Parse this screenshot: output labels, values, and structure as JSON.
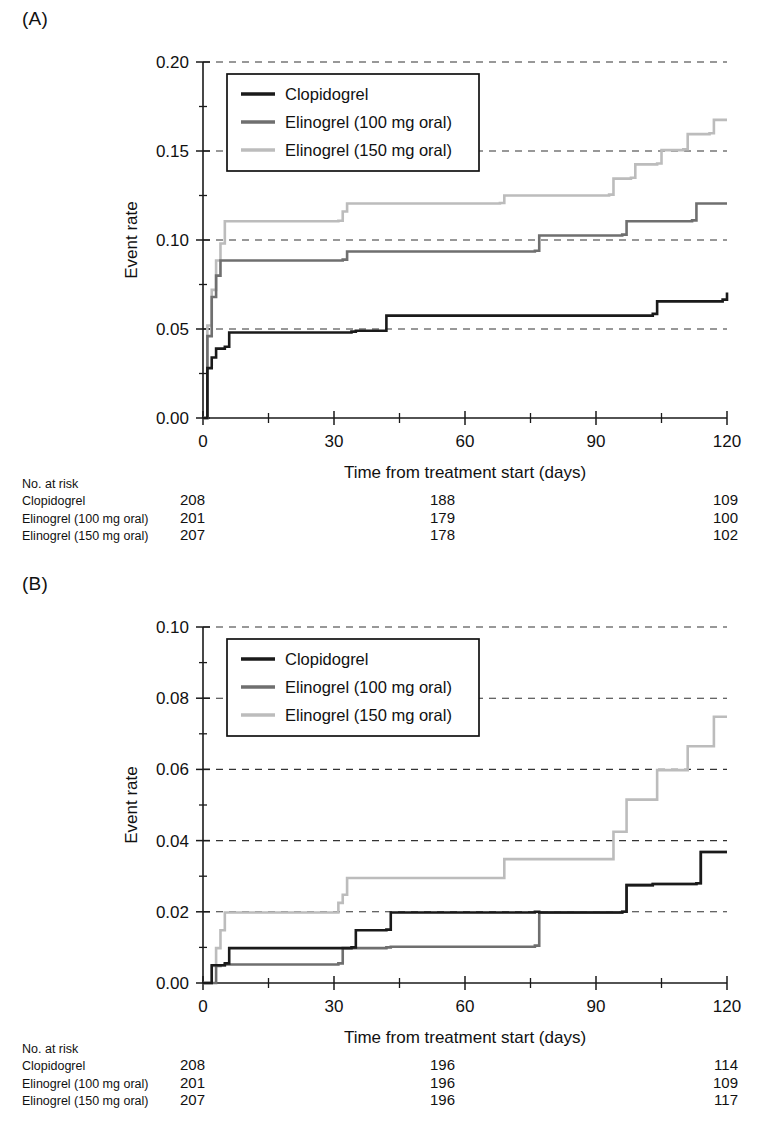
{
  "figure": {
    "panels": [
      {
        "id": "A",
        "label": "(A)",
        "risk_header": "No. at risk"
      },
      {
        "id": "B",
        "label": "(B)",
        "risk_header": "No. at risk"
      }
    ]
  },
  "colors": {
    "clopidogrel": "#1a1a1a",
    "elinogrel_100": "#6f6f6f",
    "elinogrel_150": "#bcbcbc",
    "axis": "#1a1a1a",
    "grid": "#333333",
    "background": "#ffffff"
  },
  "chart_data": [
    {
      "type": "line",
      "panel": "A",
      "title": "(A)",
      "xlabel": "Time from treatment start (days)",
      "ylabel": "Event rate",
      "xlim": [
        0,
        120
      ],
      "ylim": [
        0,
        0.2
      ],
      "xticks": [
        0,
        30,
        60,
        90,
        120
      ],
      "xtick_labels": [
        "0",
        "30",
        "60",
        "90",
        "120"
      ],
      "x_minor_ticks": [
        15,
        45,
        75,
        105
      ],
      "yticks": [
        0.0,
        0.05,
        0.1,
        0.15,
        0.2
      ],
      "ytick_labels": [
        "0.00",
        "0.05",
        "0.10",
        "0.15",
        "0.20"
      ],
      "grid": "horizontal-dashed",
      "legend_position": "upper-left-inside",
      "series": [
        {
          "name": "Clopidogrel",
          "color": "#1a1a1a",
          "step": "post",
          "x": [
            0,
            1,
            2,
            3,
            5,
            6,
            34,
            35,
            42,
            103,
            104,
            119,
            120
          ],
          "y": [
            0.0,
            0.028,
            0.034,
            0.039,
            0.04,
            0.048,
            0.0485,
            0.049,
            0.0575,
            0.0585,
            0.0655,
            0.0665,
            0.0705
          ]
        },
        {
          "name": "Elinogrel (100 mg oral)",
          "color": "#6f6f6f",
          "step": "post",
          "x": [
            0,
            1,
            2,
            3,
            4,
            32,
            33,
            76,
            77,
            96,
            97,
            112,
            113,
            120
          ],
          "y": [
            0.0,
            0.046,
            0.068,
            0.08,
            0.0885,
            0.089,
            0.0935,
            0.094,
            0.1025,
            0.103,
            0.1105,
            0.111,
            0.1205,
            0.1205
          ]
        },
        {
          "name": "Elinogrel (150 mg oral)",
          "color": "#bcbcbc",
          "step": "post",
          "x": [
            0,
            1,
            2,
            3,
            4,
            5,
            31,
            32,
            33,
            68,
            69,
            93,
            94,
            98,
            99,
            104,
            105,
            110,
            111,
            116,
            117,
            120
          ],
          "y": [
            0.0,
            0.052,
            0.072,
            0.0885,
            0.098,
            0.1105,
            0.1108,
            0.116,
            0.1205,
            0.1208,
            0.125,
            0.1255,
            0.1345,
            0.135,
            0.1425,
            0.143,
            0.1505,
            0.151,
            0.1595,
            0.16,
            0.1675,
            0.1675
          ]
        }
      ],
      "risk_table": {
        "header": "No. at risk",
        "timepoints": [
          0,
          60,
          120
        ],
        "rows": [
          {
            "label": "Clopidogrel",
            "values": [
              "208",
              "188",
              "109"
            ]
          },
          {
            "label": "Elinogrel (100 mg oral)",
            "values": [
              "201",
              "179",
              "100"
            ]
          },
          {
            "label": "Elinogrel (150 mg oral)",
            "values": [
              "207",
              "178",
              "102"
            ]
          }
        ]
      }
    },
    {
      "type": "line",
      "panel": "B",
      "title": "(B)",
      "xlabel": "Time from treatment start (days)",
      "ylabel": "Event rate",
      "xlim": [
        0,
        120
      ],
      "ylim": [
        0,
        0.1
      ],
      "xticks": [
        0,
        30,
        60,
        90,
        120
      ],
      "xtick_labels": [
        "0",
        "30",
        "60",
        "90",
        "120"
      ],
      "x_minor_ticks": [
        15,
        45,
        75,
        105
      ],
      "yticks": [
        0.0,
        0.02,
        0.04,
        0.06,
        0.08,
        0.1
      ],
      "ytick_labels": [
        "0.00",
        "0.02",
        "0.04",
        "0.06",
        "0.08",
        "0.10"
      ],
      "grid": "horizontal-dashed",
      "legend_position": "upper-left-inside",
      "series": [
        {
          "name": "Clopidogrel",
          "color": "#1a1a1a",
          "step": "post",
          "x": [
            0,
            1,
            2,
            5,
            6,
            34,
            35,
            42,
            43,
            76,
            77,
            96,
            97,
            103,
            104,
            113,
            114,
            119,
            120
          ],
          "y": [
            0.0,
            0.0,
            0.005,
            0.0055,
            0.0098,
            0.01,
            0.0148,
            0.015,
            0.0198,
            0.02,
            0.0198,
            0.02,
            0.0275,
            0.0278,
            0.0278,
            0.028,
            0.0368,
            0.0368,
            0.0368
          ]
        },
        {
          "name": "Elinogrel (100 mg oral)",
          "color": "#6f6f6f",
          "step": "post",
          "x": [
            0,
            2,
            3,
            4,
            5,
            31,
            32,
            42,
            43,
            76,
            77,
            96,
            97,
            103,
            104,
            113,
            114,
            120
          ],
          "y": [
            0.0,
            0.0,
            0.0048,
            0.005,
            0.0052,
            0.0055,
            0.0098,
            0.01,
            0.0102,
            0.0105,
            0.0198,
            0.02,
            0.0275,
            0.0278,
            0.0278,
            0.028,
            0.0368,
            0.0368
          ]
        },
        {
          "name": "Elinogrel (150 mg oral)",
          "color": "#bcbcbc",
          "step": "post",
          "x": [
            0,
            1,
            2,
            3,
            4,
            5,
            30,
            31,
            32,
            33,
            68,
            69,
            93,
            94,
            96,
            97,
            103,
            104,
            110,
            111,
            116,
            117,
            120
          ],
          "y": [
            0.0,
            0.0,
            0.0048,
            0.0098,
            0.0148,
            0.0198,
            0.0198,
            0.0225,
            0.0248,
            0.0295,
            0.0295,
            0.0348,
            0.0348,
            0.0425,
            0.0425,
            0.0515,
            0.0515,
            0.0598,
            0.0598,
            0.0665,
            0.0665,
            0.0748,
            0.0748
          ]
        }
      ],
      "risk_table": {
        "header": "No. at risk",
        "timepoints": [
          0,
          60,
          120
        ],
        "rows": [
          {
            "label": "Clopidogrel",
            "values": [
              "208",
              "196",
              "114"
            ]
          },
          {
            "label": "Elinogrel (100 mg oral)",
            "values": [
              "201",
              "196",
              "109"
            ]
          },
          {
            "label": "Elinogrel (150 mg oral)",
            "values": [
              "207",
              "196",
              "117"
            ]
          }
        ]
      }
    }
  ]
}
